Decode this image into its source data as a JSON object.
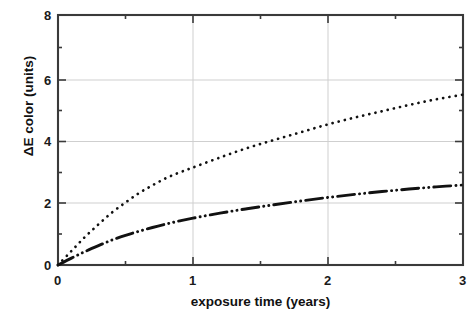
{
  "chart_data": {
    "type": "line",
    "title": "",
    "subtitle": "",
    "xlabel": "exposure time (years)",
    "ylabel": "ΔE color (units)",
    "xlim": [
      0,
      3
    ],
    "ylim": [
      0,
      8
    ],
    "xticks": [
      0,
      1,
      2,
      3
    ],
    "xtick_labels": [
      "0",
      "1",
      "2",
      "3"
    ],
    "yticks": [
      0,
      2,
      4,
      6,
      8
    ],
    "ytick_labels": [
      "0",
      "2",
      "4",
      "6",
      "8"
    ],
    "minor_yticks": [
      1,
      3,
      5,
      7
    ],
    "grid": true,
    "grid_color": "#c8c8c8",
    "legend": "none",
    "frame_color": "#3a3a3a",
    "series": [
      {
        "name": "upper-curve",
        "style": "dotted",
        "color": "#111111",
        "x": [
          0.0,
          0.1,
          0.2,
          0.3,
          0.4,
          0.5,
          0.6,
          0.7,
          0.8,
          0.9,
          1.0,
          1.2,
          1.4,
          1.6,
          1.8,
          2.0,
          2.2,
          2.4,
          2.6,
          2.8,
          3.0
        ],
        "y": [
          0.0,
          0.45,
          0.9,
          1.3,
          1.68,
          2.0,
          2.3,
          2.55,
          2.78,
          2.96,
          3.12,
          3.44,
          3.74,
          4.0,
          4.25,
          4.5,
          4.72,
          4.92,
          5.12,
          5.3,
          5.45
        ]
      },
      {
        "name": "lower-curve",
        "style": "dash-dot-dot",
        "color": "#111111",
        "x": [
          0.0,
          0.1,
          0.2,
          0.3,
          0.4,
          0.5,
          0.6,
          0.7,
          0.8,
          0.9,
          1.0,
          1.2,
          1.4,
          1.6,
          1.8,
          2.0,
          2.2,
          2.4,
          2.6,
          2.8,
          3.0
        ],
        "y": [
          0.0,
          0.22,
          0.43,
          0.62,
          0.8,
          0.95,
          1.08,
          1.2,
          1.31,
          1.41,
          1.5,
          1.66,
          1.8,
          1.93,
          2.05,
          2.16,
          2.26,
          2.35,
          2.43,
          2.5,
          2.56
        ]
      }
    ]
  },
  "axes": {
    "x_title": "exposure time (years)",
    "y_title": "ΔE color (units)",
    "x_tick_0": "0",
    "x_tick_1": "1",
    "x_tick_2": "2",
    "x_tick_3": "3",
    "y_tick_0": "0",
    "y_tick_2": "2",
    "y_tick_4": "4",
    "y_tick_6": "6",
    "y_tick_8": "8"
  }
}
